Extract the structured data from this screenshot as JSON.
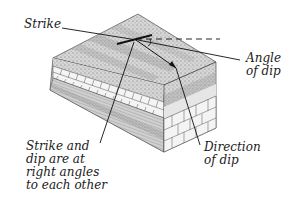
{
  "diagram": {
    "labels": {
      "strike": "Strike",
      "angle_of_dip": [
        "Angle",
        "of dip"
      ],
      "direction_of_dip": [
        "Direction",
        "of dip"
      ],
      "right_angles_note": [
        "Strike and",
        "dip are at",
        "right angles",
        "to each other"
      ]
    },
    "colors": {
      "line": "#1a1a1a",
      "stipple_light": "#d9d9d9",
      "stipple_mid": "#bdbdbd",
      "stipple_dark": "#9a9a9a",
      "band_light": "#e8e8e8",
      "brick": "#f4f4f4",
      "background": "#ffffff"
    }
  }
}
